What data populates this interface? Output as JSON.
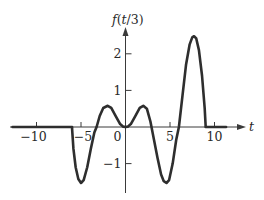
{
  "chart_data": {
    "type": "line",
    "title": "",
    "xlabel": "t",
    "ylabel": "f(t/3)",
    "xlim": [
      -12.5,
      13.3
    ],
    "ylim": [
      -1.8,
      2.8
    ],
    "grid": false,
    "legend": null,
    "x_ticks": [
      -10,
      -5,
      0,
      5,
      10
    ],
    "x_tick_labels": [
      "−10",
      "−5",
      "0",
      "5",
      "10"
    ],
    "y_ticks": [
      -1,
      1,
      2
    ],
    "y_tick_labels": [
      "−1",
      "1",
      "2"
    ],
    "series": [
      {
        "name": "f(t/3)",
        "x": [
          -12.7,
          -6.0,
          -6.0,
          -5.85,
          -5.6,
          -5.3,
          -5.0,
          -4.7,
          -4.3,
          -3.9,
          -3.5,
          -3.25,
          -2.9,
          -2.5,
          -2.0,
          -1.6,
          -1.1,
          -0.6,
          -0.25,
          0.0,
          0.25,
          0.6,
          1.1,
          1.6,
          2.0,
          2.4,
          2.8,
          3.2,
          3.6,
          4.0,
          4.3,
          4.6,
          4.9,
          5.3,
          5.7,
          6.0,
          6.4,
          6.8,
          7.2,
          7.5,
          7.7,
          7.95,
          8.25,
          8.6,
          8.9,
          9.0,
          9.0,
          11.3
        ],
        "y": [
          0,
          0,
          -0.05,
          -0.6,
          -1.1,
          -1.42,
          -1.53,
          -1.45,
          -1.1,
          -0.6,
          -0.15,
          0.0,
          0.3,
          0.52,
          0.58,
          0.52,
          0.3,
          0.08,
          0.01,
          0.0,
          0.01,
          0.08,
          0.3,
          0.52,
          0.58,
          0.5,
          0.15,
          -0.35,
          -0.85,
          -1.3,
          -1.48,
          -1.53,
          -1.45,
          -1.0,
          -0.35,
          0.0,
          0.85,
          1.7,
          2.25,
          2.45,
          2.48,
          2.42,
          2.1,
          1.4,
          0.5,
          0.05,
          0,
          0
        ]
      }
    ]
  },
  "labels": {
    "y_axis_title_f": "f",
    "y_axis_title_open": "(",
    "y_axis_title_t": "t",
    "y_axis_title_rest": "/3)",
    "x_axis_title": "t"
  }
}
